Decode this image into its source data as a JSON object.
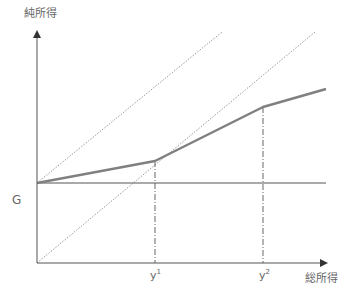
{
  "diagram": {
    "y_axis_label": "純所得",
    "x_axis_label": "総所得",
    "g_label": "G",
    "y1": {
      "base": "y",
      "sup": "1"
    },
    "y2": {
      "base": "y",
      "sup": "2"
    },
    "colors": {
      "axis": "#555555",
      "income_line": "#808080",
      "dotted": "#999999",
      "text": "#666666"
    },
    "points": {
      "origin": [
        37,
        263
      ],
      "g": [
        37,
        183
      ],
      "k1": [
        155,
        161
      ],
      "k2": [
        263,
        107
      ],
      "end": [
        326,
        89
      ]
    },
    "lines": [
      {
        "name": "45-degree line from origin",
        "from": [
          37,
          263
        ],
        "to": [
          315,
          32
        ]
      },
      {
        "name": "45-degree line from G",
        "from": [
          37,
          183
        ],
        "to": [
          222,
          32
        ]
      },
      {
        "name": "guaranteed income G",
        "from": [
          37,
          183
        ],
        "to": [
          326,
          183
        ]
      },
      {
        "name": "net income schedule",
        "points": [
          [
            37,
            183
          ],
          [
            155,
            161
          ],
          [
            263,
            107
          ],
          [
            326,
            89
          ]
        ]
      }
    ]
  }
}
